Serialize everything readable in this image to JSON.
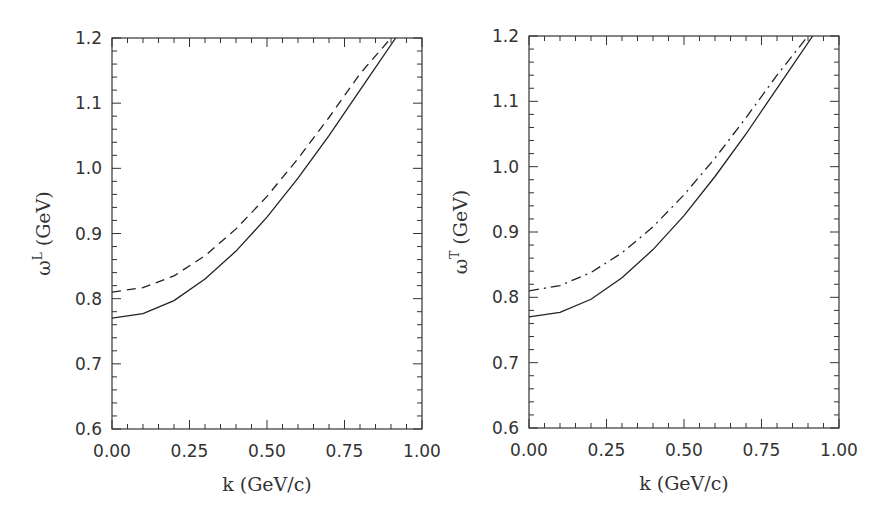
{
  "figure": {
    "note": "Intermediate curve values are approximate; only endpoints (k=0 starts and top-edge crossings) were directly measured."
  },
  "chart_data": [
    {
      "type": "line",
      "panel": "left",
      "title": "",
      "xlabel": "k (GeV/c)",
      "ylabel": "ω^L (GeV)",
      "ylabel_symbol": "ω",
      "ylabel_superscript": "L",
      "ylabel_unit": "(GeV)",
      "xlim": [
        0.0,
        1.0
      ],
      "ylim": [
        0.6,
        1.2
      ],
      "xticks": [
        "0.00",
        "0.25",
        "0.50",
        "0.75",
        "1.00"
      ],
      "yticks": [
        "0.6",
        "0.7",
        "0.8",
        "0.9",
        "1.0",
        "1.1",
        "1.2"
      ],
      "grid": false,
      "legend": "none",
      "series": [
        {
          "name": "solid",
          "style": "solid",
          "x": [
            0.0,
            0.1,
            0.2,
            0.3,
            0.4,
            0.5,
            0.6,
            0.7,
            0.8,
            0.915
          ],
          "y": [
            0.77,
            0.777,
            0.797,
            0.83,
            0.873,
            0.925,
            0.985,
            1.05,
            1.12,
            1.2
          ],
          "measured_points": "k=0 start (0.77) and top-edge crossing (k≈0.915) measured; others approximate"
        },
        {
          "name": "dashed",
          "style": "dashed",
          "x": [
            0.0,
            0.1,
            0.2,
            0.3,
            0.4,
            0.5,
            0.6,
            0.7,
            0.8,
            0.9
          ],
          "y": [
            0.81,
            0.817,
            0.835,
            0.866,
            0.907,
            0.957,
            1.015,
            1.078,
            1.145,
            1.2
          ],
          "measured_points": "k=0 start (0.81) and top-edge crossing (k≈0.90) measured; others approximate"
        }
      ]
    },
    {
      "type": "line",
      "panel": "right",
      "title": "",
      "xlabel": "k (GeV/c)",
      "ylabel": "ω^T (GeV)",
      "ylabel_symbol": "ω",
      "ylabel_superscript": "T",
      "ylabel_unit": "(GeV)",
      "xlim": [
        0.0,
        1.0
      ],
      "ylim": [
        0.6,
        1.2
      ],
      "xticks": [
        "0.00",
        "0.25",
        "0.50",
        "0.75",
        "1.00"
      ],
      "yticks": [
        "0.6",
        "0.7",
        "0.8",
        "0.9",
        "1.0",
        "1.1",
        "1.2"
      ],
      "grid": false,
      "legend": "none",
      "series": [
        {
          "name": "solid",
          "style": "solid",
          "x": [
            0.0,
            0.1,
            0.2,
            0.3,
            0.4,
            0.5,
            0.6,
            0.7,
            0.8,
            0.915
          ],
          "y": [
            0.77,
            0.777,
            0.797,
            0.83,
            0.873,
            0.925,
            0.985,
            1.05,
            1.12,
            1.2
          ],
          "measured_points": "assumed identical to left solid curve; not separately sampled"
        },
        {
          "name": "dash-dot",
          "style": "dashdot",
          "x": [
            0.0,
            0.1,
            0.2,
            0.3,
            0.4,
            0.5,
            0.6,
            0.7,
            0.8,
            0.9
          ],
          "y": [
            0.81,
            0.818,
            0.838,
            0.868,
            0.908,
            0.957,
            1.013,
            1.075,
            1.14,
            1.2
          ],
          "measured_points": "k=0 start (~0.81) and top-edge crossing (k≈0.90) estimated; interior approximate"
        }
      ]
    }
  ]
}
